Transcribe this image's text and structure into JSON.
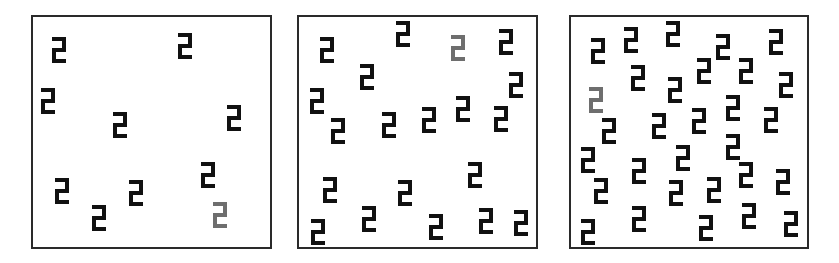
{
  "figure": {
    "colors": {
      "background": "#ffffff",
      "border": "#2a2a2a",
      "distractor": "#111111",
      "target": "#6e6e6e"
    },
    "glyph": {
      "name": "block-two-glyph",
      "width": 14,
      "height": 26,
      "stroke": 4
    },
    "panels": [
      {
        "id": "panel-1",
        "x": 31,
        "y": 15,
        "w": 241,
        "h": 234,
        "set_size": 10,
        "items": [
          {
            "x": 52,
            "y": 37,
            "target": false
          },
          {
            "x": 178,
            "y": 33,
            "target": false
          },
          {
            "x": 41,
            "y": 88,
            "target": false
          },
          {
            "x": 113,
            "y": 112,
            "target": false
          },
          {
            "x": 227,
            "y": 105,
            "target": false
          },
          {
            "x": 55,
            "y": 178,
            "target": false
          },
          {
            "x": 92,
            "y": 205,
            "target": false
          },
          {
            "x": 129,
            "y": 180,
            "target": false
          },
          {
            "x": 201,
            "y": 162,
            "target": false
          },
          {
            "x": 213,
            "y": 202,
            "target": true
          }
        ]
      },
      {
        "id": "panel-2",
        "x": 297,
        "y": 15,
        "w": 241,
        "h": 234,
        "set_size": 20,
        "items": [
          {
            "x": 320,
            "y": 37,
            "target": false
          },
          {
            "x": 396,
            "y": 21,
            "target": false
          },
          {
            "x": 451,
            "y": 35,
            "target": true
          },
          {
            "x": 499,
            "y": 29,
            "target": false
          },
          {
            "x": 509,
            "y": 72,
            "target": false
          },
          {
            "x": 310,
            "y": 88,
            "target": false
          },
          {
            "x": 360,
            "y": 64,
            "target": false
          },
          {
            "x": 331,
            "y": 118,
            "target": false
          },
          {
            "x": 382,
            "y": 112,
            "target": false
          },
          {
            "x": 422,
            "y": 107,
            "target": false
          },
          {
            "x": 456,
            "y": 96,
            "target": false
          },
          {
            "x": 494,
            "y": 106,
            "target": false
          },
          {
            "x": 323,
            "y": 177,
            "target": false
          },
          {
            "x": 398,
            "y": 180,
            "target": false
          },
          {
            "x": 468,
            "y": 162,
            "target": false
          },
          {
            "x": 311,
            "y": 219,
            "target": false
          },
          {
            "x": 362,
            "y": 206,
            "target": false
          },
          {
            "x": 429,
            "y": 214,
            "target": false
          },
          {
            "x": 479,
            "y": 208,
            "target": false
          },
          {
            "x": 514,
            "y": 210,
            "target": false
          }
        ]
      },
      {
        "id": "panel-3",
        "x": 569,
        "y": 15,
        "w": 240,
        "h": 234,
        "set_size": 30,
        "items": [
          {
            "x": 591,
            "y": 38,
            "target": false
          },
          {
            "x": 624,
            "y": 27,
            "target": false
          },
          {
            "x": 666,
            "y": 21,
            "target": false
          },
          {
            "x": 716,
            "y": 34,
            "target": false
          },
          {
            "x": 769,
            "y": 29,
            "target": false
          },
          {
            "x": 631,
            "y": 65,
            "target": false
          },
          {
            "x": 697,
            "y": 58,
            "target": false
          },
          {
            "x": 739,
            "y": 58,
            "target": false
          },
          {
            "x": 779,
            "y": 72,
            "target": false
          },
          {
            "x": 668,
            "y": 77,
            "target": false
          },
          {
            "x": 589,
            "y": 87,
            "target": true
          },
          {
            "x": 726,
            "y": 95,
            "target": false
          },
          {
            "x": 764,
            "y": 107,
            "target": false
          },
          {
            "x": 692,
            "y": 108,
            "target": false
          },
          {
            "x": 652,
            "y": 113,
            "target": false
          },
          {
            "x": 602,
            "y": 118,
            "target": false
          },
          {
            "x": 581,
            "y": 147,
            "target": false
          },
          {
            "x": 676,
            "y": 145,
            "target": false
          },
          {
            "x": 726,
            "y": 134,
            "target": false
          },
          {
            "x": 632,
            "y": 158,
            "target": false
          },
          {
            "x": 739,
            "y": 162,
            "target": false
          },
          {
            "x": 776,
            "y": 169,
            "target": false
          },
          {
            "x": 594,
            "y": 178,
            "target": false
          },
          {
            "x": 669,
            "y": 180,
            "target": false
          },
          {
            "x": 707,
            "y": 177,
            "target": false
          },
          {
            "x": 632,
            "y": 206,
            "target": false
          },
          {
            "x": 742,
            "y": 203,
            "target": false
          },
          {
            "x": 699,
            "y": 215,
            "target": false
          },
          {
            "x": 784,
            "y": 211,
            "target": false
          },
          {
            "x": 581,
            "y": 219,
            "target": false
          }
        ]
      }
    ]
  }
}
